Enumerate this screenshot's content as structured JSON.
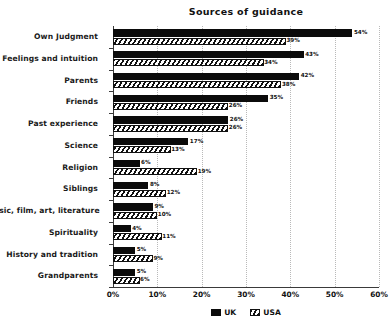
{
  "chart_data": {
    "type": "bar",
    "title": "Sources of guidance",
    "xlabel": "",
    "ylabel": "",
    "orientation": "horizontal",
    "grid": true,
    "legend_position": "bottom-center",
    "xlim": [
      0,
      60
    ],
    "xticks": [
      "0%",
      "10%",
      "20%",
      "30%",
      "40%",
      "50%",
      "60%"
    ],
    "xtick_values": [
      0,
      10,
      20,
      30,
      40,
      50,
      60
    ],
    "categories": [
      "Own Judgment",
      "Feelings and intuition",
      "Parents",
      "Friends",
      "Past experience",
      "Science",
      "Religion",
      "Siblings",
      "Music, film, art, literature",
      "Spirituality",
      "History and tradition",
      "Grandparents"
    ],
    "series": [
      {
        "name": "UK",
        "color": "#0b0b0b",
        "pattern": "solid",
        "values": [
          54,
          43,
          42,
          35,
          26,
          17,
          6,
          8,
          9,
          4,
          5,
          5
        ],
        "labels": [
          "54%",
          "43%",
          "42%",
          "35%",
          "26%",
          "17%",
          "6%",
          "8%",
          "9%",
          "4%",
          "5%",
          "5%"
        ]
      },
      {
        "name": "USA",
        "color": "#ffffff",
        "pattern": "diagonal-hatch",
        "values": [
          39,
          34,
          38,
          26,
          26,
          13,
          19,
          12,
          10,
          11,
          9,
          6
        ],
        "labels": [
          "39%",
          "34%",
          "38%",
          "26%",
          "26%",
          "13%",
          "19%",
          "12%",
          "10%",
          "11%",
          "9%",
          "6%"
        ]
      }
    ]
  }
}
